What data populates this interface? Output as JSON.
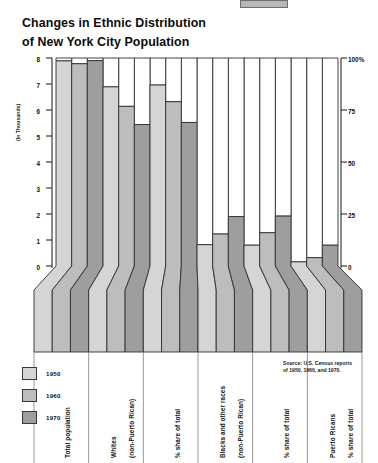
{
  "title": {
    "line1": "Changes in Ethnic Distribution",
    "line2": "of New York City Population"
  },
  "axes": {
    "left_label": "(In Thousands)",
    "left_ticks": [
      "8",
      "7",
      "6",
      "5",
      "4",
      "3",
      "2",
      "1",
      "0"
    ],
    "right_ticks": [
      "100%",
      "75",
      "50",
      "25",
      "0"
    ]
  },
  "legend": {
    "items": [
      {
        "label": "1950",
        "color": "#d5d5d5"
      },
      {
        "label": "1960",
        "color": "#bdbdbd"
      },
      {
        "label": "1970",
        "color": "#9e9e9e"
      }
    ]
  },
  "source": "Source: U.S. Census reports of 1950, 1960, and 1970.",
  "categories": [
    {
      "id": "total-population",
      "label_lines": [
        "Total population"
      ]
    },
    {
      "id": "whites-count",
      "label_lines": [
        "Whites",
        "(non-Puerto Rican)"
      ]
    },
    {
      "id": "whites-share",
      "label_lines": [
        "% share of total"
      ]
    },
    {
      "id": "blacks-other-count",
      "label_lines": [
        "Blacks and other races",
        "(non-Puerto Rican)"
      ]
    },
    {
      "id": "blacks-other-share",
      "label_lines": [
        "% share of total"
      ]
    },
    {
      "id": "puerto-ricans-share",
      "label_lines": [
        "Puerto Ricans",
        "% share of total"
      ]
    }
  ],
  "chart_data": {
    "type": "bar",
    "title": "Changes in Ethnic Distribution of New York City Population",
    "subtitle": "",
    "xlabel": "",
    "ylabel": "(In Thousands)",
    "ylim": [
      0,
      8
    ],
    "y2label": "%",
    "y2lim": [
      0,
      100
    ],
    "grid": false,
    "legend_position": "bottom-left",
    "categories": [
      "Total population",
      "Whites (non-Puerto Rican)",
      "Whites % share of total",
      "Blacks and other races (non-Puerto Rican)",
      "Blacks and other races % share of total",
      "Puerto Ricans % share of total"
    ],
    "series": [
      {
        "name": "1950",
        "color": "#d5d5d5",
        "values": [
          7.89,
          6.89,
          87.0,
          0.82,
          10.0,
          2.0
        ]
      },
      {
        "name": "1960",
        "color": "#bdbdbd",
        "values": [
          7.78,
          6.14,
          79.0,
          1.23,
          16.0,
          4.0
        ]
      },
      {
        "name": "1970",
        "color": "#9e9e9e",
        "values": [
          7.9,
          5.44,
          69.0,
          1.9,
          24.0,
          10.0
        ]
      }
    ],
    "series_axis": [
      "left",
      "left",
      "right",
      "left",
      "right",
      "right"
    ]
  }
}
